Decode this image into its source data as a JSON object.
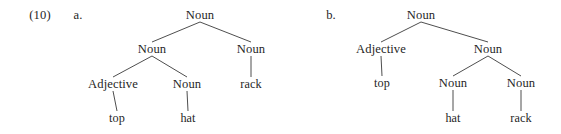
{
  "figure": {
    "example_number": "(10)",
    "trees": [
      {
        "letter": "a.",
        "letter_pos": {
          "x": 78,
          "y": 15
        },
        "nodes": [
          {
            "id": "a-root",
            "label": "Noun",
            "x": 200,
            "y": 15,
            "role": "nonterminal"
          },
          {
            "id": "a-n1",
            "label": "Noun",
            "x": 152,
            "y": 49,
            "role": "nonterminal"
          },
          {
            "id": "a-n2",
            "label": "Noun",
            "x": 251,
            "y": 49,
            "role": "nonterminal"
          },
          {
            "id": "a-adj",
            "label": "Adjective",
            "x": 113,
            "y": 84,
            "role": "nonterminal"
          },
          {
            "id": "a-n3",
            "label": "Noun",
            "x": 187,
            "y": 84,
            "role": "nonterminal"
          },
          {
            "id": "a-top",
            "label": "top",
            "x": 117,
            "y": 118,
            "role": "terminal"
          },
          {
            "id": "a-hat",
            "label": "hat",
            "x": 188,
            "y": 118,
            "role": "terminal"
          },
          {
            "id": "a-rack",
            "label": "rack",
            "x": 251,
            "y": 84,
            "role": "terminal"
          }
        ],
        "edges": [
          {
            "from": "a-root",
            "to": "a-n1"
          },
          {
            "from": "a-root",
            "to": "a-n2"
          },
          {
            "from": "a-n1",
            "to": "a-adj"
          },
          {
            "from": "a-n1",
            "to": "a-n3"
          },
          {
            "from": "a-adj",
            "to": "a-top"
          },
          {
            "from": "a-n3",
            "to": "a-hat"
          },
          {
            "from": "a-n2",
            "to": "a-rack"
          }
        ]
      },
      {
        "letter": "b.",
        "letter_pos": {
          "x": 331,
          "y": 15
        },
        "nodes": [
          {
            "id": "b-root",
            "label": "Noun",
            "x": 421,
            "y": 15,
            "role": "nonterminal"
          },
          {
            "id": "b-adj",
            "label": "Adjective",
            "x": 381,
            "y": 49,
            "role": "nonterminal"
          },
          {
            "id": "b-n1",
            "label": "Noun",
            "x": 488,
            "y": 49,
            "role": "nonterminal"
          },
          {
            "id": "b-n2",
            "label": "Noun",
            "x": 453,
            "y": 83,
            "role": "nonterminal"
          },
          {
            "id": "b-n3",
            "label": "Noun",
            "x": 521,
            "y": 83,
            "role": "nonterminal"
          },
          {
            "id": "b-top",
            "label": "top",
            "x": 382,
            "y": 83,
            "role": "terminal"
          },
          {
            "id": "b-hat",
            "label": "hat",
            "x": 453,
            "y": 118,
            "role": "terminal"
          },
          {
            "id": "b-rack",
            "label": "rack",
            "x": 521,
            "y": 118,
            "role": "terminal"
          }
        ],
        "edges": [
          {
            "from": "b-root",
            "to": "b-adj"
          },
          {
            "from": "b-root",
            "to": "b-n1"
          },
          {
            "from": "b-adj",
            "to": "b-top"
          },
          {
            "from": "b-n1",
            "to": "b-n2"
          },
          {
            "from": "b-n1",
            "to": "b-n3"
          },
          {
            "from": "b-n2",
            "to": "b-hat"
          },
          {
            "from": "b-n3",
            "to": "b-rack"
          }
        ]
      }
    ],
    "example_number_pos": {
      "x": 40,
      "y": 15
    },
    "colors": {
      "background": "#ffffff",
      "text": "#1f1f1f",
      "branch_line": "#3a3a3a"
    },
    "style": {
      "node_half_height": 7,
      "line_width": 0.9
    }
  }
}
